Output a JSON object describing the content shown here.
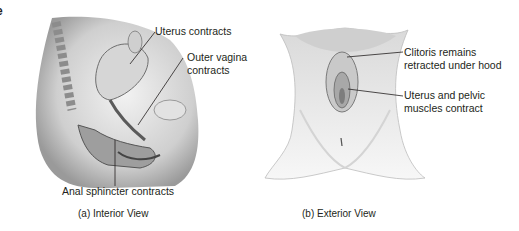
{
  "figure": {
    "edge_fragment": "e",
    "panel_a": {
      "caption": "(a) Interior View",
      "labels": {
        "uterus": "Uterus contracts",
        "outer_vagina_line1": "Outer vagina",
        "outer_vagina_line2": "contracts",
        "anal_sphincter": "Anal sphincter contracts"
      }
    },
    "panel_b": {
      "caption": "(b) Exterior View",
      "labels": {
        "clitoris_line1": "Clitoris remains",
        "clitoris_line2": "retracted under hood",
        "uterus_pelvic_line1": "Uterus and pelvic",
        "uterus_pelvic_line2": "muscles contract"
      }
    },
    "colors": {
      "text": "#231f20",
      "tissue_light": "#e6e6e6",
      "tissue_mid": "#bdbdbd",
      "tissue_dark": "#7a7a7a",
      "leader_line": "#231f20"
    }
  }
}
